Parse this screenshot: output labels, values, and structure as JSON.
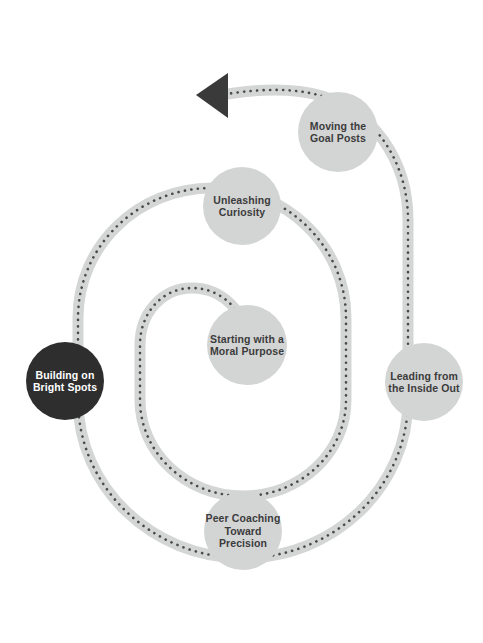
{
  "diagram": {
    "type": "spiral-process-cycle",
    "title": "",
    "direction": "outward-counterclockwise-ending-in-arrow",
    "colors": {
      "background": "#ffffff",
      "band_fill": "#d4d5d5",
      "band_edge": "#c9cacA",
      "dotted_line": "#4a4a4a",
      "node_fill": "#d3d4d4",
      "node_highlight_fill": "#2e2e2e",
      "label_text": "#3c3c3c",
      "label_text_on_dark": "#ffffff",
      "arrowhead": "#3a3a3a"
    },
    "arrow": {
      "name": "spiral-end-arrowhead",
      "tip_x": 196,
      "tip_y": 95,
      "direction": "left"
    },
    "nodes": [
      {
        "id": "starting-moral-purpose",
        "label": "Starting with a\nMoral Purpose",
        "order": 1,
        "cx": 247,
        "cy": 345,
        "r": 40,
        "highlighted": false
      },
      {
        "id": "unleashing-curiosity",
        "label": "Unleashing\nCuriosity",
        "order": 2,
        "cx": 242,
        "cy": 206,
        "r": 39,
        "highlighted": false
      },
      {
        "id": "moving-goal-posts",
        "label": "Moving the\nGoal Posts",
        "order": 3,
        "cx": 338,
        "cy": 132,
        "r": 40,
        "highlighted": false
      },
      {
        "id": "leading-inside-out",
        "label": "Leading from\nthe Inside Out",
        "order": 4,
        "cx": 424,
        "cy": 382,
        "r": 39,
        "highlighted": false
      },
      {
        "id": "peer-coaching-precision",
        "label": "Peer Coaching\nToward\nPrecision",
        "order": 5,
        "cx": 243,
        "cy": 531,
        "r": 39,
        "highlighted": false
      },
      {
        "id": "building-bright-spots",
        "label": "Building on\nBright Spots",
        "order": 6,
        "cx": 65,
        "cy": 381,
        "r": 39,
        "highlighted": true
      }
    ]
  }
}
